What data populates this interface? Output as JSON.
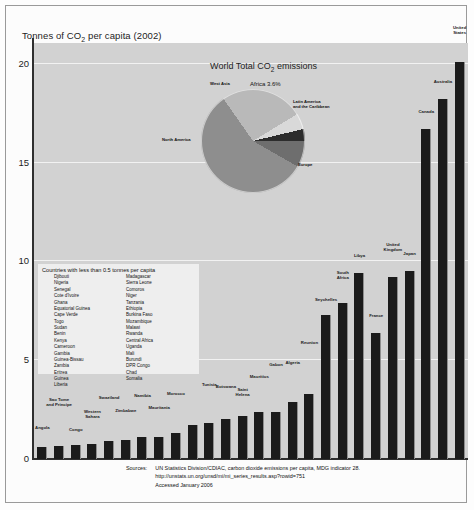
{
  "axis_title": "Tonnes of CO2 per capita (2002)",
  "axis_title_pre": "Tonnes of CO",
  "axis_title_sub": "2",
  "axis_title_post": " per capita (2002)",
  "pie_title_pre": "World Total CO",
  "pie_title_sub": "2",
  "pie_title_post": " emissions",
  "countries_box": {
    "title": "Countries with less than 0.5 tonnes per capita",
    "column1": [
      "Djibouti",
      "Nigeria",
      "Senegal",
      "Cote d'Ivoire",
      "Ghana",
      "Equatorial Guinea",
      "Cape Verde",
      "Togo",
      "Sudan",
      "Benin",
      "Kenya",
      "Cameroon",
      "Gambia",
      "Guinea-Bissau",
      "Zambia",
      "Eritrea",
      "Guinea",
      "Liberia"
    ],
    "column2": [
      "Madagascar",
      "Sierra Leone",
      "Comoros",
      "Niger",
      "Tanzania",
      "Ethiopia",
      "Burkina Faso",
      "Mozambique",
      "Malawi",
      "Rwanda",
      "Central Africa",
      "Uganda",
      "Mali",
      "Burundi",
      "DPR Congo",
      "Chad",
      "Somalia"
    ]
  },
  "source": {
    "label": "Sources:",
    "line1": "UN Statistics Division/CDIAC, carbon dioxide emissions per capita, MDG indicator 28.",
    "line2": "http://unstats.un.org/unsd/mi/mi_series_results.asp?rowid=751",
    "line3": "Accessed January 2006"
  },
  "colors": {
    "plot_background": "#d2d2d2",
    "bar_fill": "#1b1b1b",
    "bar_edge": "#8e8e8e",
    "gridline": "#f2f2f2",
    "axis": "#2f2f2f",
    "textbox_background": "#eeeeee",
    "pie_north_america": "#b9b9b9",
    "pie_west_asia": "#d9d9d9",
    "pie_africa": "#2c2c2c",
    "pie_latin_america": "#6e6e6e",
    "pie_europe": "#8e8e8e"
  },
  "chart_data": {
    "type": "bar",
    "title": "Tonnes of CO2 per capita (2002)",
    "xlabel": "",
    "ylabel": "Tonnes of CO2 per capita",
    "ylim": [
      0,
      21
    ],
    "yticks": [
      0,
      5,
      10,
      15,
      20
    ],
    "grid": true,
    "grid_axis": "y",
    "categories": [
      "Angola",
      "Sao Tome and Principe",
      "Congo",
      "Western Sahara",
      "Swaziland",
      "Zimbabwe",
      "Namibia",
      "Mauritania",
      "Morocco",
      "Egypt",
      "Tunisia",
      "Botswana",
      "Saint Helena",
      "Mauritius",
      "Gabon",
      "Algeria",
      "Reunion",
      "Seychelles",
      "South Africa",
      "Libya",
      "France",
      "United Kingdom",
      "Japan",
      "Canada",
      "Australia",
      "United States"
    ],
    "values": [
      0.6,
      0.65,
      0.7,
      0.75,
      0.9,
      0.95,
      1.1,
      1.1,
      1.3,
      1.7,
      1.8,
      2.0,
      2.2,
      2.4,
      2.4,
      2.9,
      3.3,
      7.3,
      7.9,
      9.4,
      6.4,
      9.2,
      9.5,
      16.7,
      18.2,
      20.1
    ],
    "annotations": [
      "Countries with less than 0.5 tonnes per capita listed in inset box"
    ]
  },
  "pie_data": {
    "type": "pie",
    "title": "World Total CO2 emissions",
    "labels": [
      "North America",
      "West Asia",
      "Africa",
      "Latin America and the Caribbean",
      "Europe"
    ],
    "values": [
      26.0,
      5.0,
      3.6,
      8.4,
      57.0
    ],
    "label_texts": {
      "north_america": "North America",
      "west_asia": "West Asia",
      "africa": "Africa 3.6%",
      "latin_america_line1": "Latin America",
      "latin_america_line2": "and the Caribbean",
      "europe": "Europe"
    }
  }
}
